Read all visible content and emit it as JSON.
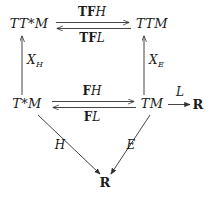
{
  "diagram": {
    "type": "commutative-diagram",
    "background_color": "#ffffff",
    "ink_color": "#1a1a1a",
    "nodes": [
      {
        "id": "TTsM",
        "label": "TT*M",
        "style": "italic",
        "x": 29,
        "y": 25
      },
      {
        "id": "TTM",
        "label": "TTM",
        "style": "italic",
        "x": 152,
        "y": 25
      },
      {
        "id": "TsM",
        "label": "T*M",
        "style": "italic",
        "x": 27,
        "y": 105
      },
      {
        "id": "TM",
        "label": "TM",
        "style": "italic",
        "x": 152,
        "y": 105
      },
      {
        "id": "Rright",
        "label": "R",
        "style": "bold-roman",
        "x": 198,
        "y": 105
      },
      {
        "id": "Rbot",
        "label": "R",
        "style": "bold-roman",
        "x": 105,
        "y": 183
      }
    ],
    "edges": [
      {
        "id": "TFH",
        "from": "TTsM",
        "to": "TTM",
        "direction": "right",
        "label_bold": "TF",
        "label_italic": "H",
        "label_x": 92,
        "label_y": 12
      },
      {
        "id": "TFL",
        "from": "TTM",
        "to": "TTsM",
        "direction": "left",
        "label_bold": "TF",
        "label_italic": "L",
        "label_x": 92,
        "label_y": 38
      },
      {
        "id": "XH",
        "from": "TsM",
        "to": "TTsM",
        "direction": "up",
        "label_bold": "",
        "label_italic": "X",
        "label_sub": "H",
        "label_x": 31,
        "label_y": 60
      },
      {
        "id": "XE",
        "from": "TM",
        "to": "TTM",
        "direction": "up",
        "label_bold": "",
        "label_italic": "X",
        "label_sub": "E",
        "label_x": 153,
        "label_y": 60
      },
      {
        "id": "FH",
        "from": "TsM",
        "to": "TM",
        "direction": "right",
        "label_bold": "F",
        "label_italic": "H",
        "label_x": 92,
        "label_y": 90
      },
      {
        "id": "FL",
        "from": "TM",
        "to": "TsM",
        "direction": "left",
        "label_bold": "F",
        "label_italic": "L",
        "label_x": 92,
        "label_y": 117
      },
      {
        "id": "L",
        "from": "TM",
        "to": "Rright",
        "direction": "right",
        "label_bold": "",
        "label_italic": "L",
        "label_x": 181,
        "label_y": 90
      },
      {
        "id": "H",
        "from": "TsM",
        "to": "Rbot",
        "direction": "diagonal-down-right",
        "label_bold": "",
        "label_italic": "H",
        "label_x": 60,
        "label_y": 145
      },
      {
        "id": "E",
        "from": "TM",
        "to": "Rbot",
        "direction": "diagonal-down-left",
        "label_bold": "",
        "label_italic": "E",
        "label_x": 131,
        "label_y": 145
      }
    ]
  }
}
